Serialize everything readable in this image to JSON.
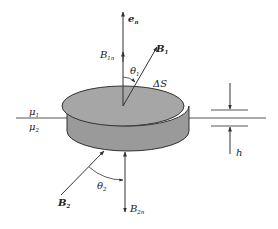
{
  "diagram": {
    "type": "boundary-condition-pillbox",
    "colors": {
      "line": "#333333",
      "body_fill": "#9a9a9a",
      "top_fill": "#a6a6a6",
      "background": "#ffffff"
    },
    "labels": {
      "normal": {
        "main": "e",
        "sub": "n"
      },
      "B1n": {
        "main": "B",
        "sub": "1n"
      },
      "B1": {
        "main": "B",
        "sub": "1"
      },
      "theta1": {
        "main": "θ",
        "sub": "1"
      },
      "deltaS": "ΔS",
      "mu1": {
        "main": "μ",
        "sub": "1"
      },
      "mu2": {
        "main": "μ",
        "sub": "2"
      },
      "h": "h",
      "theta2": {
        "main": "θ",
        "sub": "2"
      },
      "B2": {
        "main": "B",
        "sub": "2"
      },
      "B2n": {
        "main": "B",
        "sub": "2n"
      }
    }
  }
}
